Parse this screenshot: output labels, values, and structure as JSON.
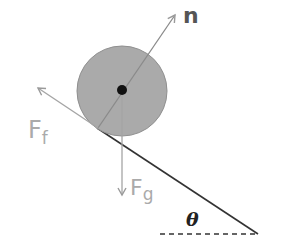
{
  "diagram": {
    "labels": {
      "normal": "n",
      "friction": "F",
      "friction_sub": "f",
      "gravity": "F",
      "gravity_sub": "g",
      "angle": "θ"
    },
    "colors": {
      "ball_fill": "#a9a9a9",
      "ball_stroke": "#8a8a8a",
      "center_dot": "#111111",
      "arrow": "#9a9a9a",
      "incline": "#333333",
      "normal_label": "#555555",
      "force_label": "#a0a0a0",
      "angle_label": "#222222"
    }
  }
}
